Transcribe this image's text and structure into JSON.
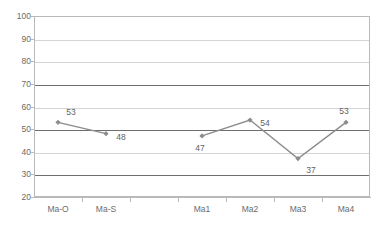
{
  "chart_data": {
    "type": "line",
    "title": "",
    "subtitle": "",
    "xlabel": "",
    "ylabel": "",
    "ylim": [
      20,
      100
    ],
    "y_ticks": [
      100,
      90,
      80,
      70,
      60,
      50,
      40,
      30,
      20
    ],
    "y_major_gridlines": [
      70,
      50,
      30
    ],
    "grid": true,
    "legend": "none",
    "categories": [
      "Ma-O",
      "Ma-S",
      "",
      "Ma1",
      "Ma2",
      "Ma3",
      "Ma4"
    ],
    "series": [
      {
        "name": "series-1",
        "color": "#8c8c8c",
        "marker": "diamond",
        "values": [
          53,
          48,
          null,
          47,
          54,
          37,
          53
        ]
      }
    ],
    "data_labels": [
      {
        "category": "Ma-O",
        "value": 53,
        "text": "53",
        "position": "above-right"
      },
      {
        "category": "Ma-S",
        "value": 48,
        "text": "48",
        "position": "right"
      },
      {
        "category": "Ma1",
        "value": 47,
        "text": "47",
        "position": "below"
      },
      {
        "category": "Ma2",
        "value": 54,
        "text": "54",
        "position": "right"
      },
      {
        "category": "Ma3",
        "value": 37,
        "text": "37",
        "position": "below-right"
      },
      {
        "category": "Ma4",
        "value": 53,
        "text": "53",
        "position": "above-left"
      }
    ],
    "colors": {
      "series_line": "#8c8c8c",
      "grid_minor": "#d4d4d4",
      "grid_major": "#6e6e6e",
      "axis": "#b9b9b9",
      "tick_text": "#6b6b6b",
      "label_text": "#5f5f5f",
      "background": "#ffffff"
    }
  }
}
